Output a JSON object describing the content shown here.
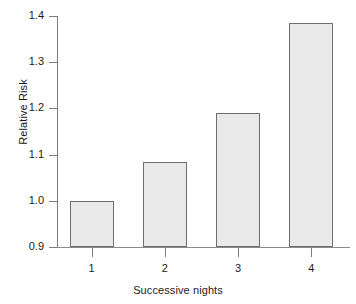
{
  "chart_data": {
    "type": "bar",
    "title": "",
    "xlabel": "Successive nights",
    "ylabel": "Relative Risk",
    "categories": [
      "1",
      "2",
      "3",
      "4"
    ],
    "values": [
      1.0,
      1.085,
      1.19,
      1.385
    ],
    "ylim": [
      0.9,
      1.4
    ],
    "yticks": [
      "0.9",
      "1.0",
      "1.1",
      "1.2",
      "1.3",
      "1.4"
    ],
    "ytick_values": [
      0.9,
      1.0,
      1.1,
      1.2,
      1.3,
      1.4
    ],
    "grid": false,
    "legend": null,
    "bar_fill_color": "#e9e9e9",
    "bar_border_color": "#6e6e6e",
    "axis_color": "#7d7d7d",
    "background_color": "#ffffff"
  }
}
